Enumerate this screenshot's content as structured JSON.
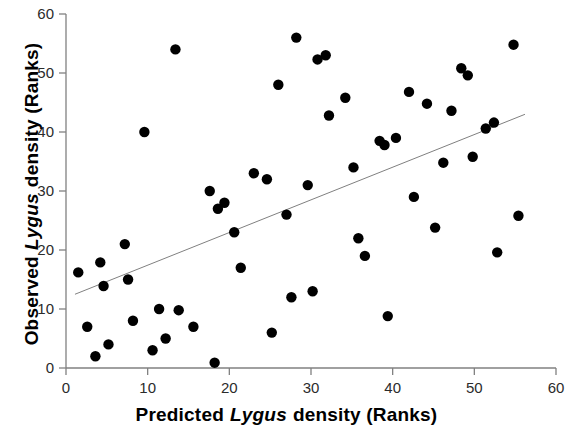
{
  "chart_data": {
    "type": "scatter",
    "title": "",
    "xlabel": "Predicted Lygus density (Ranks)",
    "ylabel": "Observed Lygus density (Ranks)",
    "xlabel_parts": [
      "Predicted",
      "Lygus",
      "density (Ranks)"
    ],
    "ylabel_parts": [
      "Observed",
      "Lygus",
      "density (Ranks)"
    ],
    "xlim": [
      0,
      60
    ],
    "ylim": [
      0,
      60
    ],
    "xticks": [
      0,
      10,
      20,
      30,
      40,
      50,
      60
    ],
    "yticks": [
      0,
      10,
      20,
      30,
      40,
      50,
      60
    ],
    "xtick_labels": [
      "0",
      "10",
      "20",
      "30",
      "40",
      "50",
      "60"
    ],
    "ytick_labels": [
      "0",
      "10",
      "20",
      "30",
      "40",
      "50",
      "60"
    ],
    "grid": false,
    "legend": false,
    "marker": "filled-circle",
    "marker_color": "#000000",
    "marker_size": 8,
    "axis_color": "#808080",
    "trendline": {
      "type": "linear-fit",
      "color": "#808080",
      "width": 1,
      "x_start": 1.1,
      "y_start": 12.5,
      "x_end": 56.2,
      "y_end": 43.0
    },
    "points": [
      [
        1.5,
        16.2
      ],
      [
        2.6,
        7.0
      ],
      [
        3.6,
        2.0
      ],
      [
        4.2,
        17.9
      ],
      [
        4.6,
        13.9
      ],
      [
        5.2,
        4.0
      ],
      [
        7.2,
        21.0
      ],
      [
        7.6,
        15.0
      ],
      [
        8.2,
        8.0
      ],
      [
        9.6,
        40.0
      ],
      [
        10.6,
        3.0
      ],
      [
        11.4,
        10.0
      ],
      [
        12.2,
        5.0
      ],
      [
        13.4,
        54.0
      ],
      [
        13.8,
        9.8
      ],
      [
        15.6,
        7.0
      ],
      [
        17.6,
        30.0
      ],
      [
        18.2,
        0.9
      ],
      [
        18.6,
        27.0
      ],
      [
        19.4,
        28.0
      ],
      [
        20.6,
        23.0
      ],
      [
        21.4,
        17.0
      ],
      [
        23.0,
        33.0
      ],
      [
        24.6,
        32.0
      ],
      [
        25.2,
        6.0
      ],
      [
        26.0,
        48.0
      ],
      [
        27.0,
        26.0
      ],
      [
        27.6,
        12.0
      ],
      [
        28.2,
        56.0
      ],
      [
        29.6,
        31.0
      ],
      [
        30.2,
        13.0
      ],
      [
        30.8,
        52.3
      ],
      [
        31.8,
        53.0
      ],
      [
        32.2,
        42.8
      ],
      [
        34.2,
        45.8
      ],
      [
        35.2,
        34.0
      ],
      [
        35.8,
        22.0
      ],
      [
        36.6,
        19.0
      ],
      [
        38.4,
        38.5
      ],
      [
        39.0,
        37.8
      ],
      [
        39.4,
        8.8
      ],
      [
        40.4,
        39.0
      ],
      [
        42.0,
        46.8
      ],
      [
        42.6,
        29.0
      ],
      [
        44.2,
        44.8
      ],
      [
        45.2,
        23.8
      ],
      [
        46.2,
        34.8
      ],
      [
        47.2,
        43.6
      ],
      [
        48.4,
        50.8
      ],
      [
        49.2,
        49.6
      ],
      [
        49.8,
        35.8
      ],
      [
        51.4,
        40.6
      ],
      [
        52.4,
        41.6
      ],
      [
        52.8,
        19.6
      ],
      [
        54.8,
        54.8
      ],
      [
        55.4,
        25.8
      ]
    ]
  }
}
